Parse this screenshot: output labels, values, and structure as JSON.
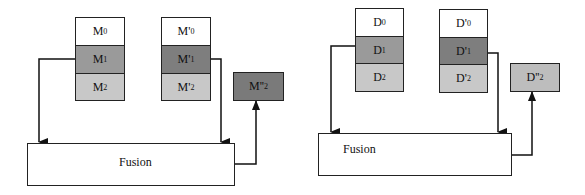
{
  "left_diagram": {
    "stack_a": [
      {
        "label": "M",
        "sub": "0",
        "color": "#ffffff"
      },
      {
        "label": "M",
        "sub": "1",
        "color": "#9a9a9a"
      },
      {
        "label": "M",
        "sub": "2",
        "color": "#c8c8c8"
      }
    ],
    "stack_b": [
      {
        "label": "M'",
        "sub": "0",
        "color": "#ffffff"
      },
      {
        "label": "M'",
        "sub": "1",
        "color": "#7e7e7e"
      },
      {
        "label": "M'",
        "sub": "2",
        "color": "#c8c8c8"
      }
    ],
    "output": {
      "label": "M''",
      "sub": "2",
      "color": "#7a7a7a"
    },
    "fusion_label": "Fusion"
  },
  "right_diagram": {
    "stack_a": [
      {
        "label": "D",
        "sub": "0",
        "color": "#ffffff"
      },
      {
        "label": "D",
        "sub": "1",
        "color": "#9a9a9a"
      },
      {
        "label": "D",
        "sub": "2",
        "color": "#c8c8c8"
      }
    ],
    "stack_b": [
      {
        "label": "D'",
        "sub": "0",
        "color": "#ffffff"
      },
      {
        "label": "D'",
        "sub": "1",
        "color": "#7e7e7e"
      },
      {
        "label": "D'",
        "sub": "2",
        "color": "#c8c8c8"
      }
    ],
    "output": {
      "label": "D''",
      "sub": "2",
      "color": "#bdbdbd"
    },
    "fusion_label": "Fusion"
  }
}
